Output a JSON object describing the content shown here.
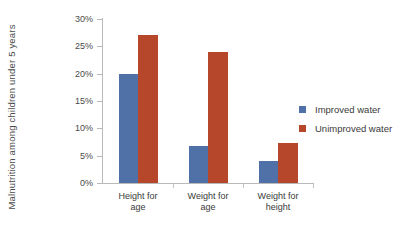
{
  "chart_data": {
    "type": "bar",
    "title": "",
    "xlabel": "",
    "ylabel": "Malnutrition among children under 5 years",
    "categories": [
      "Height for age",
      "Weight for age",
      "Weight for height"
    ],
    "category_lines": [
      [
        "Height for",
        "age"
      ],
      [
        "Weight for",
        "age"
      ],
      [
        "Weight for",
        "height"
      ]
    ],
    "series": [
      {
        "name": "Improved water",
        "color": "#4f71a8",
        "values": [
          20.0,
          6.7,
          4.0
        ]
      },
      {
        "name": "Unimproved water",
        "color": "#b6472a",
        "values": [
          27.0,
          24.0,
          7.4
        ]
      }
    ],
    "ylim": [
      0,
      30
    ],
    "ytick_values": [
      0,
      5,
      10,
      15,
      20,
      25,
      30
    ],
    "ytick_labels": [
      "0%",
      "5%",
      "10%",
      "15%",
      "20%",
      "25%",
      "30%"
    ],
    "grid": false,
    "legend_position": "right",
    "axis_color": "#b9b9b9",
    "background": "#ffffff"
  }
}
